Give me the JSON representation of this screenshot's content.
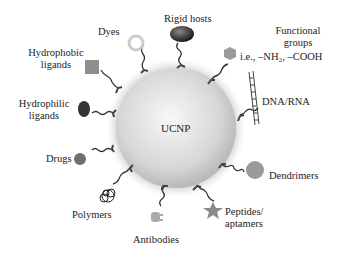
{
  "center": {
    "label": "UCNP"
  },
  "labels": {
    "rigid_hosts": "Rigid hosts",
    "functional_groups_1": "Functional",
    "functional_groups_2": "groups",
    "functional_groups_3": "i.e., –NH₂, –COOH",
    "dna_rna": "DNA/RNA",
    "dendrimers": "Dendrimers",
    "peptides_1": "Peptides/",
    "peptides_2": "aptamers",
    "antibodies": "Antibodies",
    "polymers": "Polymers",
    "drugs": "Drugs",
    "hydrophilic_1": "Hydrophilic",
    "hydrophilic_2": "ligands",
    "hydrophobic_1": "Hydrophobic",
    "hydrophobic_2": "ligands",
    "dyes": "Dyes"
  },
  "colors": {
    "sphere_light": "#f4f4f4",
    "sphere_dark": "#b9b9b9",
    "ligand_gray": "#8a8a8a",
    "dark": "#333333"
  }
}
